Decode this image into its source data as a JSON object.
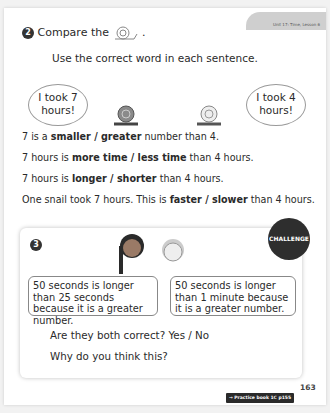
{
  "header": {
    "unit_label": "Unit 17: Time, Lesson 6"
  },
  "question2": {
    "number": "2",
    "prompt": "Compare the",
    "prompt_end": ".",
    "icon": "snail-icon",
    "instruction": "Use the correct word in each sentence.",
    "bubble_left": "I took 7 hours!",
    "bubble_right": "I took 4 hours!",
    "sentences": [
      {
        "pre": "7 is a ",
        "choice": "smaller / greater",
        "post": " number than 4."
      },
      {
        "pre": "7 hours is ",
        "choice": "more time / less time",
        "post": " than 4 hours."
      },
      {
        "pre": "7 hours is ",
        "choice": "longer / shorter",
        "post": " than 4 hours."
      },
      {
        "pre": "One snail took 7 hours. This is ",
        "choice": "faster / slower",
        "post": " than 4 hours."
      }
    ]
  },
  "question3": {
    "number": "3",
    "badge": "CHALLENGE",
    "speech_left": "50 seconds is longer than 25 seconds because it is a greater number.",
    "speech_right": "50 seconds is longer than 1 minute because it is a greater number.",
    "question": "Are they both correct? Yes / No",
    "followup": "Why do you think this?"
  },
  "footer": {
    "practice_link": "→ Practice book 1C p155",
    "page_number": "163"
  }
}
